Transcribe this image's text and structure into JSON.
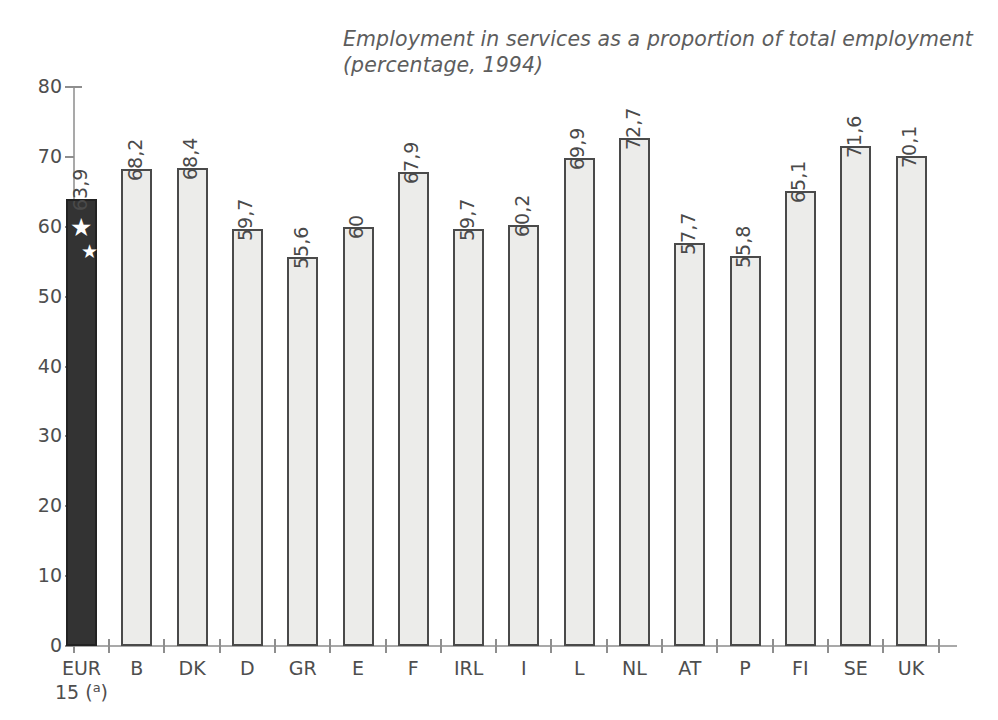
{
  "chart_data": {
    "type": "bar",
    "title": "Employment in services as a proportion of total employment",
    "subtitle": "(percentage, 1994)",
    "xlabel": "",
    "ylabel": "",
    "ylim": [
      0,
      80
    ],
    "yticks": [
      0,
      10,
      20,
      30,
      40,
      50,
      60,
      70,
      80
    ],
    "grid": false,
    "legend": "none",
    "categories": [
      "EUR 15 (a)",
      "B",
      "DK",
      "D",
      "GR",
      "E",
      "F",
      "IRL",
      "I",
      "L",
      "NL",
      "AT",
      "P",
      "FI",
      "SE",
      "UK"
    ],
    "category_labels": [
      {
        "line1": "EUR",
        "line2": "15 (",
        "sup": "a",
        "line2_end": ")"
      },
      {
        "line1": "B"
      },
      {
        "line1": "DK"
      },
      {
        "line1": "D"
      },
      {
        "line1": "GR"
      },
      {
        "line1": "E"
      },
      {
        "line1": "F"
      },
      {
        "line1": "IRL"
      },
      {
        "line1": "I"
      },
      {
        "line1": "L"
      },
      {
        "line1": "NL"
      },
      {
        "line1": "AT"
      },
      {
        "line1": "P"
      },
      {
        "line1": "FI"
      },
      {
        "line1": "SE"
      },
      {
        "line1": "UK"
      }
    ],
    "values": [
      63.9,
      68.2,
      68.4,
      59.7,
      55.6,
      60.0,
      67.9,
      59.7,
      60.2,
      69.9,
      72.7,
      57.7,
      55.8,
      65.1,
      71.6,
      70.1
    ],
    "value_labels": [
      "63,9",
      "68,2",
      "68,4",
      "59,7",
      "55,6",
      "60",
      "67,9",
      "59,7",
      "60,2",
      "69,9",
      "72,7",
      "57,7",
      "55,8",
      "65,1",
      "71,6",
      "70,1"
    ],
    "highlight_index": 0,
    "highlight_decoration": "eu-stars",
    "colors": {
      "bar_fill": "#ececea",
      "bar_border": "#4a4a4a",
      "highlight_fill": "#333333",
      "axis": "#a9a9a9",
      "text": "#4e4e4e",
      "title": "#5d5d5d",
      "background": "#ffffff"
    }
  }
}
